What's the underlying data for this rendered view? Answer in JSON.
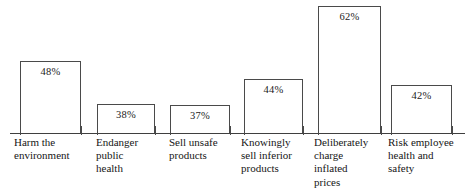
{
  "chart_data": {
    "type": "bar",
    "title": "",
    "subtitle": "",
    "xlabel": "",
    "ylabel": "",
    "ylim": [
      0,
      70
    ],
    "grid": false,
    "legend": null,
    "value_label_position": "inside-top",
    "value_suffix": "%",
    "categories": [
      "Harm the\nenvironment",
      "Endanger\npublic\nhealth",
      "Sell unsafe\nproducts",
      "Knowingly\nsell inferior\nproducts",
      "Deliberately\ncharge\ninflated\nprices",
      "Risk employee\nhealth and\nsafety"
    ],
    "values": [
      48,
      38,
      37,
      44,
      62,
      42
    ],
    "value_labels": [
      "48%",
      "38%",
      "37%",
      "44%",
      "62%",
      "42%"
    ],
    "colors": {
      "bar_fill": "#ffffff",
      "bar_border": "#4a4a4a",
      "axis": "#3f3f3f",
      "text": "#161616"
    }
  },
  "bars": [
    {
      "label": "Harm the\nenvironment",
      "value_label": "48%",
      "left": 20,
      "width": 61,
      "height": 73,
      "label_left": 14,
      "label_width": 84
    },
    {
      "label": "Endanger\npublic\nhealth",
      "value_label": "38%",
      "left": 97,
      "width": 58,
      "height": 30,
      "label_left": 96,
      "label_width": 70
    },
    {
      "label": "Sell unsafe\nproducts",
      "value_label": "37%",
      "left": 170,
      "width": 60,
      "height": 29,
      "label_left": 169,
      "label_width": 76
    },
    {
      "label": "Knowingly\nsell inferior\nproducts",
      "value_label": "44%",
      "left": 244,
      "width": 59,
      "height": 55,
      "label_left": 241,
      "label_width": 78
    },
    {
      "label": "Deliberately\ncharge\ninflated\nprices",
      "value_label": "62%",
      "left": 318,
      "width": 63,
      "height": 128,
      "label_left": 314,
      "label_width": 78
    },
    {
      "label": "Risk employee\nhealth and\nsafety",
      "value_label": "42%",
      "left": 391,
      "width": 61,
      "height": 49,
      "label_left": 388,
      "label_width": 86
    }
  ],
  "ticks": [
    20,
    81,
    97,
    155,
    170,
    230,
    244,
    303,
    318,
    381,
    391,
    452
  ]
}
